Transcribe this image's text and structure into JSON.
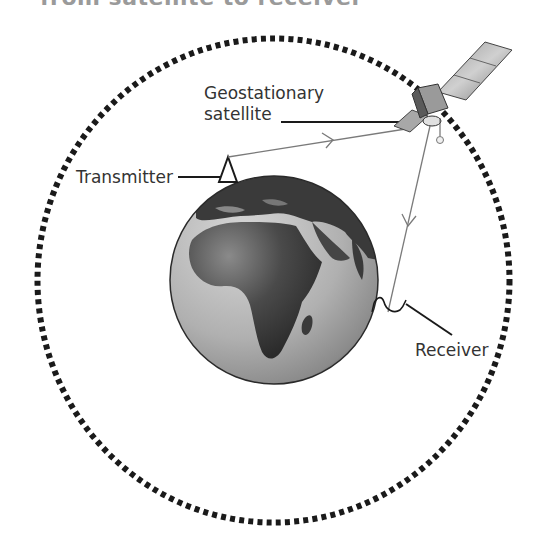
{
  "diagram": {
    "title": "from satellite to receiver",
    "labels": {
      "satellite_line1": "Geostationary",
      "satellite_line2": "satellite",
      "transmitter": "Transmitter",
      "receiver": "Receiver"
    },
    "elements": {
      "orbit": "geostationary-orbit-dotted-circle",
      "earth": "earth-globe-africa-view",
      "satellite": "satellite-icon",
      "transmitter": "transmitter-triangle-icon",
      "receiver": "receiver-dish-icon",
      "uplink": "uplink-signal-arrow",
      "downlink": "downlink-signal-arrow"
    },
    "colors": {
      "orbit": "#1a1a1a",
      "earth_ocean": "#b4b4b4",
      "earth_land": "#3a3a3a",
      "signal": "#7a7a7a",
      "text": "#333333"
    }
  }
}
